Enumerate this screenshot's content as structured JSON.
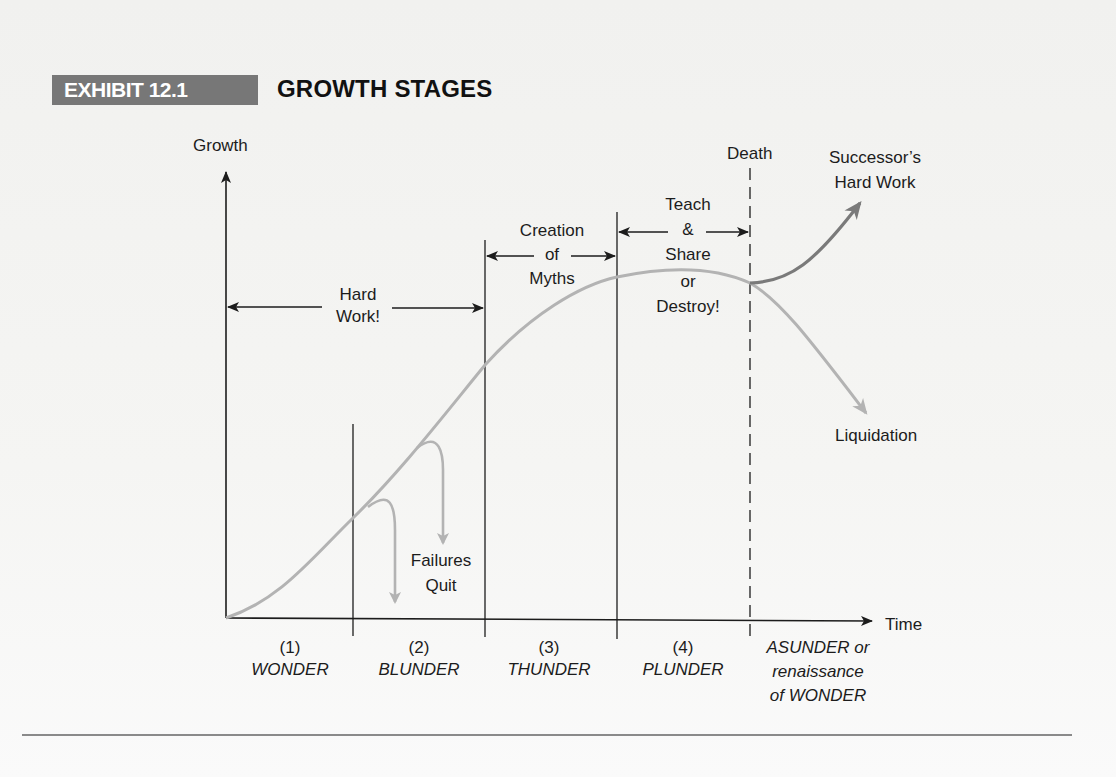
{
  "exhibit": {
    "badge": "EXHIBIT 12.1",
    "title": "GROWTH STAGES"
  },
  "colors": {
    "badge_bg": "#777777",
    "badge_text": "#ffffff",
    "curve": "#b3b3b3",
    "successor_curve": "#7a7a7a",
    "axis": "#1c1c1c"
  },
  "axes": {
    "y_label": "Growth",
    "x_label": "Time"
  },
  "markers": {
    "death": "Death"
  },
  "annotations": {
    "hard_work": [
      "Hard",
      "Work!"
    ],
    "creation_of_myths": [
      "Creation",
      "of",
      "Myths"
    ],
    "teach_share": [
      "Teach",
      "&",
      "Share",
      "or",
      "Destroy!"
    ],
    "successor": [
      "Successor’s",
      "Hard Work"
    ],
    "liquidation": "Liquidation",
    "failures_quit": [
      "Failures",
      "Quit"
    ]
  },
  "stages": [
    {
      "number": "(1)",
      "name": "WONDER"
    },
    {
      "number": "(2)",
      "name": "BLUNDER"
    },
    {
      "number": "(3)",
      "name": "THUNDER"
    },
    {
      "number": "(4)",
      "name": "PLUNDER"
    },
    {
      "number": "",
      "name": [
        "ASUNDER or",
        "renaissance",
        "of WONDER"
      ]
    }
  ]
}
